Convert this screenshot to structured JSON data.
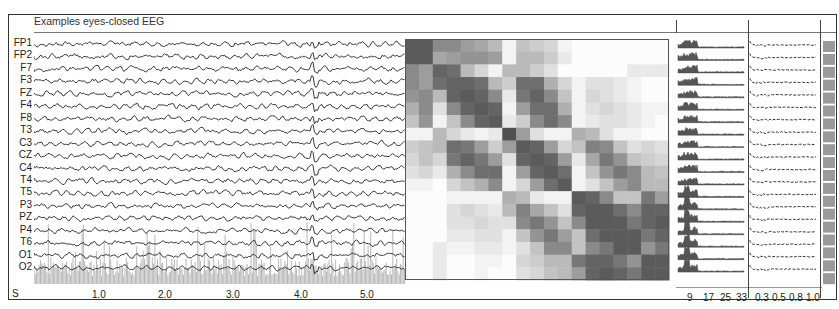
{
  "title": "Examples eyes-closed EEG",
  "channels": [
    "FP1",
    "FP2",
    "F7",
    "F3",
    "FZ",
    "F4",
    "F8",
    "T3",
    "C3",
    "CZ",
    "C4",
    "T4",
    "T5",
    "P3",
    "PZ",
    "P4",
    "T6",
    "O1",
    "O2"
  ],
  "time_axis": {
    "unit_label": "S",
    "ticks": [
      "1.0",
      "2.0",
      "3.0",
      "4.0",
      "5.0"
    ]
  },
  "spectrum_axis": {
    "ticks": [
      "9",
      "17",
      "25",
      "33"
    ]
  },
  "coherence_axis": {
    "ticks": [
      "0.3",
      "0.5",
      "0.8",
      "1.0"
    ]
  },
  "colors": {
    "trace": "#3a3a3a",
    "artifact": "#b8b8b8",
    "frame": "#333333",
    "colorbar": "#9a9a9a"
  },
  "chart_data": [
    {
      "type": "line",
      "title": "Examples eyes-closed EEG",
      "xlabel": "S",
      "x_ticks": [
        1.0,
        2.0,
        3.0,
        4.0,
        5.0
      ],
      "xlim": [
        0,
        5.5
      ],
      "series_names": [
        "FP1",
        "FP2",
        "F7",
        "F3",
        "FZ",
        "F4",
        "F8",
        "T3",
        "C3",
        "CZ",
        "C4",
        "T4",
        "T5",
        "P3",
        "PZ",
        "P4",
        "T6",
        "O1",
        "O2"
      ],
      "notes": "19-channel EEG traces, stacked; prominent transient near 4.2 s across channels; gray spiky artifact overlay in lower occipital channels"
    },
    {
      "type": "heatmap",
      "title": "",
      "rows": [
        "FP1",
        "FP2",
        "F7",
        "F3",
        "FZ",
        "F4",
        "F8",
        "T3",
        "C3",
        "CZ",
        "C4",
        "T4",
        "T5",
        "P3",
        "PZ",
        "P4",
        "T6",
        "O1",
        "O2"
      ],
      "cols": [
        "FP1",
        "FP2",
        "F7",
        "F3",
        "FZ",
        "F4",
        "F8",
        "T3",
        "C3",
        "CZ",
        "C4",
        "T4",
        "T5",
        "P3",
        "PZ",
        "P4",
        "T6",
        "O1",
        "O2"
      ],
      "colormap": "grayscale (dark = high)",
      "values": [
        [
          0.85,
          0.85,
          0.6,
          0.6,
          0.5,
          0.45,
          0.35,
          0.05,
          0.3,
          0.25,
          0.2,
          0.05,
          0.0,
          0.0,
          0.0,
          0.0,
          0.0,
          0.0,
          0.0
        ],
        [
          0.85,
          0.85,
          0.45,
          0.5,
          0.55,
          0.55,
          0.5,
          0.05,
          0.35,
          0.35,
          0.25,
          0.1,
          0.0,
          0.0,
          0.0,
          0.0,
          0.0,
          0.0,
          0.0
        ],
        [
          0.6,
          0.5,
          0.8,
          0.75,
          0.35,
          0.2,
          0.05,
          0.35,
          0.35,
          0.25,
          0.15,
          0.0,
          0.0,
          0.0,
          0.0,
          0.0,
          0.1,
          0.1,
          0.1
        ],
        [
          0.6,
          0.5,
          0.75,
          0.8,
          0.8,
          0.75,
          0.35,
          0.25,
          0.75,
          0.75,
          0.4,
          0.2,
          0.05,
          0.15,
          0.15,
          0.1,
          0.05,
          0.0,
          0.0
        ],
        [
          0.55,
          0.6,
          0.35,
          0.8,
          0.85,
          0.8,
          0.6,
          0.1,
          0.7,
          0.8,
          0.6,
          0.3,
          0.05,
          0.2,
          0.15,
          0.1,
          0.05,
          0.0,
          0.0
        ],
        [
          0.4,
          0.6,
          0.15,
          0.6,
          0.8,
          0.85,
          0.8,
          0.05,
          0.5,
          0.75,
          0.75,
          0.4,
          0.05,
          0.15,
          0.2,
          0.15,
          0.1,
          0.05,
          0.05
        ],
        [
          0.3,
          0.55,
          0.05,
          0.3,
          0.6,
          0.8,
          0.85,
          0.1,
          0.25,
          0.6,
          0.75,
          0.6,
          0.05,
          0.1,
          0.15,
          0.15,
          0.1,
          0.05,
          0.0
        ],
        [
          0.05,
          0.05,
          0.35,
          0.2,
          0.1,
          0.05,
          0.1,
          0.9,
          0.5,
          0.15,
          0.05,
          0.05,
          0.4,
          0.35,
          0.15,
          0.05,
          0.05,
          0.0,
          0.0
        ],
        [
          0.25,
          0.3,
          0.35,
          0.75,
          0.7,
          0.5,
          0.25,
          0.5,
          0.85,
          0.8,
          0.5,
          0.2,
          0.3,
          0.65,
          0.6,
          0.3,
          0.15,
          0.2,
          0.15
        ],
        [
          0.2,
          0.3,
          0.2,
          0.7,
          0.8,
          0.7,
          0.5,
          0.15,
          0.8,
          0.85,
          0.8,
          0.5,
          0.1,
          0.45,
          0.7,
          0.55,
          0.3,
          0.25,
          0.2
        ],
        [
          0.15,
          0.2,
          0.1,
          0.4,
          0.6,
          0.75,
          0.75,
          0.05,
          0.5,
          0.8,
          0.85,
          0.75,
          0.05,
          0.3,
          0.55,
          0.7,
          0.6,
          0.35,
          0.3
        ],
        [
          0.05,
          0.05,
          0.0,
          0.2,
          0.3,
          0.4,
          0.6,
          0.05,
          0.2,
          0.5,
          0.75,
          0.85,
          0.05,
          0.15,
          0.3,
          0.5,
          0.6,
          0.35,
          0.35
        ],
        [
          0.0,
          0.0,
          0.0,
          0.05,
          0.05,
          0.05,
          0.05,
          0.4,
          0.35,
          0.1,
          0.05,
          0.05,
          0.85,
          0.8,
          0.6,
          0.3,
          0.3,
          0.7,
          0.5
        ],
        [
          0.0,
          0.0,
          0.0,
          0.15,
          0.2,
          0.15,
          0.1,
          0.35,
          0.65,
          0.45,
          0.3,
          0.15,
          0.8,
          0.85,
          0.85,
          0.75,
          0.6,
          0.8,
          0.8
        ],
        [
          0.0,
          0.0,
          0.0,
          0.15,
          0.15,
          0.2,
          0.15,
          0.15,
          0.6,
          0.7,
          0.55,
          0.3,
          0.6,
          0.85,
          0.85,
          0.85,
          0.7,
          0.8,
          0.85
        ],
        [
          0.0,
          0.0,
          0.0,
          0.1,
          0.1,
          0.15,
          0.15,
          0.05,
          0.3,
          0.55,
          0.7,
          0.5,
          0.3,
          0.75,
          0.85,
          0.85,
          0.85,
          0.7,
          0.8
        ],
        [
          0.0,
          0.0,
          0.1,
          0.05,
          0.05,
          0.1,
          0.1,
          0.05,
          0.15,
          0.3,
          0.6,
          0.6,
          0.3,
          0.6,
          0.7,
          0.85,
          0.85,
          0.55,
          0.7
        ],
        [
          0.0,
          0.0,
          0.1,
          0.0,
          0.0,
          0.05,
          0.05,
          0.0,
          0.2,
          0.25,
          0.35,
          0.35,
          0.7,
          0.8,
          0.8,
          0.7,
          0.55,
          0.85,
          0.85
        ],
        [
          0.0,
          0.0,
          0.1,
          0.0,
          0.0,
          0.05,
          0.0,
          0.0,
          0.15,
          0.2,
          0.3,
          0.35,
          0.5,
          0.8,
          0.85,
          0.8,
          0.7,
          0.85,
          0.85
        ]
      ]
    },
    {
      "type": "area",
      "title": "",
      "xlabel": "Hz",
      "x_ticks": [
        9,
        17,
        25,
        33
      ],
      "notes": "per-channel power spectra, peak in alpha band (~9-11 Hz), stronger peaks in posterior channels"
    },
    {
      "type": "line",
      "title": "",
      "x_ticks": [
        0.3,
        0.5,
        0.8,
        1.0
      ],
      "notes": "per-channel small-amplitude traces on coherence/lag axis"
    }
  ]
}
